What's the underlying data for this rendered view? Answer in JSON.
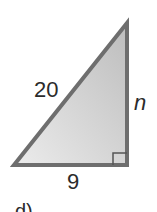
{
  "figure": {
    "type": "right-triangle",
    "fill_gradient": [
      "#ececec",
      "#c4c4c4"
    ],
    "stroke_color": "#6e6e6e",
    "vertices": {
      "top": [
        127,
        23
      ],
      "bottom_left": [
        14,
        165
      ],
      "bottom_right": [
        127,
        165
      ]
    },
    "right_angle_at": "bottom_right",
    "labels": {
      "hypotenuse": "20",
      "vertical_leg": "n",
      "horizontal_leg": "9"
    },
    "part_label": "d)"
  }
}
